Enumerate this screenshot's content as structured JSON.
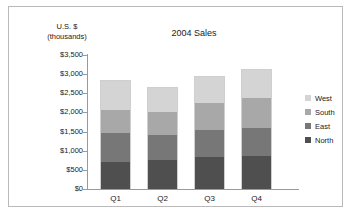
{
  "chart_data": {
    "type": "bar",
    "subtype": "stacked-column",
    "title": "2004 Sales",
    "xlabel": "",
    "ylabel": "U.S. $ (thousands)",
    "ylabel_lines": [
      "U.S. $",
      "(thousands)"
    ],
    "categories": [
      "Q1",
      "Q2",
      "Q3",
      "Q4"
    ],
    "series": [
      {
        "name": "North",
        "color": "#4f4f4f",
        "values": [
          700,
          750,
          825,
          850
        ]
      },
      {
        "name": "East",
        "color": "#777777",
        "values": [
          775,
          650,
          725,
          750
        ]
      },
      {
        "name": "South",
        "color": "#a8a8a8",
        "values": [
          600,
          625,
          700,
          775
        ]
      },
      {
        "name": "West",
        "color": "#d4d4d4",
        "values": [
          760,
          630,
          710,
          760
        ]
      }
    ],
    "totals": [
      2835,
      2655,
      2960,
      3135
    ],
    "ylim": [
      0,
      3500
    ],
    "ytick_step": 500,
    "ytick_labels": [
      "$3,500",
      "$3,000",
      "$2,500",
      "$2,000",
      "$1,500",
      "$1,000",
      "$500",
      "$0"
    ],
    "ytick_values": [
      3500,
      3000,
      2500,
      2000,
      1500,
      1000,
      500,
      0
    ],
    "grid": false,
    "legend_position": "right",
    "legend_order": [
      "West",
      "South",
      "East",
      "North"
    ]
  }
}
